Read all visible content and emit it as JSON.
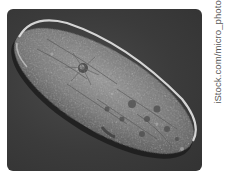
{
  "image": {
    "subject": "Paramecium micrograph",
    "alt": "Microscope photograph of an elongated, slipper-shaped paramecium cell lying diagonally on a dark gray background",
    "colors": {
      "background": "#3b3b3b",
      "cell_body": "#8a8a8a",
      "cell_rim_highlight": "#e6e6e6",
      "cell_shadow": "#1c1c1c",
      "page": "#ffffff"
    }
  },
  "credit": {
    "text": "iStock.com/micro_photo",
    "color": "#555555"
  }
}
